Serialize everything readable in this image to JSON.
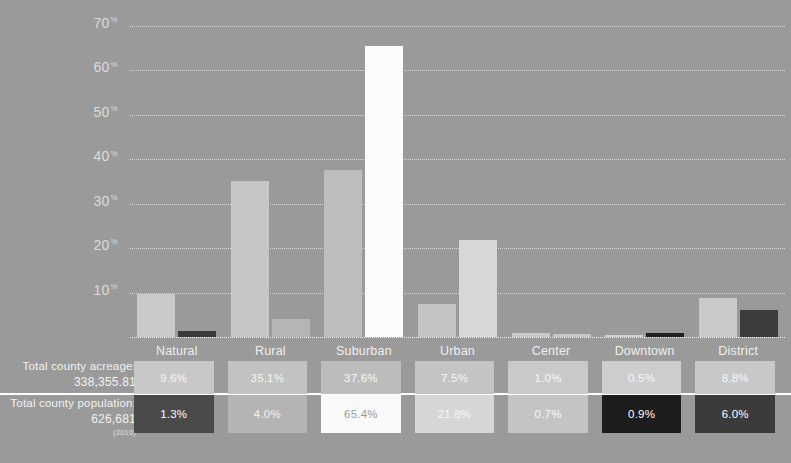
{
  "chart_data": {
    "type": "bar",
    "title": "",
    "subtitle": "",
    "xlabel": "",
    "ylabel": "",
    "ylim": [
      0,
      73
    ],
    "grid": true,
    "legend_position": "none",
    "categories": [
      "Natural",
      "Rural",
      "Suburban",
      "Urban",
      "Center",
      "Downtown",
      "District"
    ],
    "ticks": [
      "10",
      "20",
      "30",
      "40",
      "50",
      "60",
      "70"
    ],
    "tick_suffix": "%",
    "series": [
      {
        "name": "Total county acreage",
        "values": [
          9.6,
          35.1,
          37.6,
          7.5,
          1.0,
          0.5,
          8.8
        ],
        "labels": [
          "9.6%",
          "35.1%",
          "37.6%",
          "7.5%",
          "1.0%",
          "0.5%",
          "8.8%"
        ],
        "bar_colors": [
          "#c9c9c9",
          "#c6c6c6",
          "#bdbdbd",
          "#c4c4c4",
          "#c9c9c9",
          "#cfcfcf",
          "#c9c9c9"
        ],
        "cell_colors": [
          "#c8c8c8",
          "#c2c2c2",
          "#bcbcbc",
          "#c4c4c4",
          "#c9c9c9",
          "#cdcdcd",
          "#c8c8c8"
        ],
        "cell_text_colors": [
          "#f5f5f5",
          "#f5f5f5",
          "#f7f7f7",
          "#f7f7f7",
          "#f8f8f8",
          "#f8f8f8",
          "#f6f6f6"
        ]
      },
      {
        "name": "Total county population",
        "values": [
          1.3,
          4.0,
          65.4,
          21.8,
          0.7,
          0.9,
          6.0
        ],
        "labels": [
          "1.3%",
          "4.0%",
          "65.4%",
          "21.8%",
          "0.7%",
          "0.9%",
          "6.0%"
        ],
        "bar_colors": [
          "#3a3a3a",
          "#b5b5b5",
          "#fbfbfb",
          "#d8d8d8",
          "#c6c6c6",
          "#1f1f1f",
          "#3c3c3c"
        ],
        "cell_colors": [
          "#4a4a4a",
          "#b4b4b4",
          "#f9f9f9",
          "#d6d6d6",
          "#c4c4c4",
          "#1c1c1c",
          "#3b3b3b"
        ],
        "cell_text_colors": [
          "#ffffff",
          "#f2f2f2",
          "#9a9a9a",
          "#f8f8f8",
          "#f8f8f8",
          "#ffffff",
          "#ffffff"
        ]
      }
    ]
  },
  "table": {
    "row_labels": [
      {
        "title": "Total county acreage:",
        "value": "338,355.81",
        "note": ""
      },
      {
        "title": "Total county population:",
        "value": "626,681",
        "note": "(2010)"
      }
    ]
  },
  "colors": {
    "background": "#9a9a9a",
    "gridline": "#e3e3e3",
    "divider": "#ffffff",
    "axis_label": "#dcdcdc"
  }
}
